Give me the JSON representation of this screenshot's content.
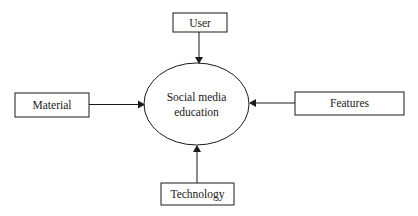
{
  "diagram": {
    "center": {
      "id": "center",
      "label_lines": [
        "Social media",
        "education"
      ]
    },
    "nodes": [
      {
        "id": "user",
        "label": "User",
        "position": "top"
      },
      {
        "id": "material",
        "label": "Material",
        "position": "left"
      },
      {
        "id": "features",
        "label": "Features",
        "position": "right"
      },
      {
        "id": "technology",
        "label": "Technology",
        "position": "bottom"
      }
    ],
    "edges": [
      {
        "from": "user",
        "to": "center"
      },
      {
        "from": "material",
        "to": "center"
      },
      {
        "from": "features",
        "to": "center"
      },
      {
        "from": "technology",
        "to": "center"
      }
    ]
  }
}
